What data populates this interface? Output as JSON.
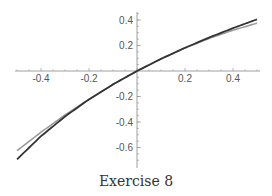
{
  "chart_data": {
    "type": "line",
    "title": "",
    "caption": "Exercise 8",
    "xlabel": "",
    "ylabel": "",
    "xlim": [
      -0.5,
      0.5
    ],
    "ylim": [
      -0.75,
      0.45
    ],
    "x_ticks": [
      -0.4,
      -0.2,
      0.2,
      0.4
    ],
    "x_tick_labels": [
      "-0.4",
      "-0.2",
      "0.2",
      "0.4"
    ],
    "y_ticks": [
      0.4,
      0.2,
      -0.2,
      -0.4,
      -0.6
    ],
    "y_tick_labels": [
      "0.4",
      "0.2",
      "-0.2",
      "-0.4",
      "-0.6"
    ],
    "grid": false,
    "legend": null,
    "series": [
      {
        "name": "ln(1+x)",
        "color": "#333333",
        "x": [
          -0.5,
          -0.4,
          -0.3,
          -0.2,
          -0.1,
          0,
          0.1,
          0.2,
          0.3,
          0.4,
          0.5
        ],
        "values": [
          -0.693,
          -0.511,
          -0.357,
          -0.223,
          -0.105,
          0,
          0.095,
          0.182,
          0.262,
          0.336,
          0.405
        ]
      },
      {
        "name": "x - x^2/2",
        "color": "#999999",
        "x": [
          -0.5,
          -0.4,
          -0.3,
          -0.2,
          -0.1,
          0,
          0.1,
          0.2,
          0.3,
          0.4,
          0.5
        ],
        "values": [
          -0.625,
          -0.48,
          -0.345,
          -0.22,
          -0.105,
          0,
          0.095,
          0.18,
          0.255,
          0.32,
          0.375
        ]
      }
    ]
  }
}
